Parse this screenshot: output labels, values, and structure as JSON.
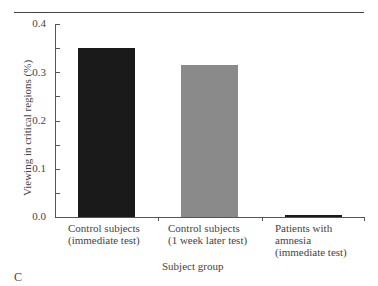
{
  "chart_data": {
    "type": "bar",
    "title": "",
    "panel_label": "C",
    "xlabel": "Subject group",
    "ylabel": "Viewing in critical regions (%)",
    "ylim": [
      0,
      0.4
    ],
    "yticks": [
      "0.0",
      "0.1",
      "0.2",
      "0.3",
      "0.4"
    ],
    "categories": [
      "Control subjects\n(immediate test)",
      "Control subjects\n(1 week later test)",
      "Patients with\namnesia\n(immediate test)"
    ],
    "values": [
      0.35,
      0.315,
      0.005
    ],
    "colors": [
      "#1a1a1a",
      "#8a8a8a",
      "#1a1a1a"
    ],
    "grid": false,
    "legend": null
  }
}
